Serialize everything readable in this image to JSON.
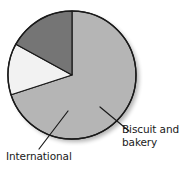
{
  "figure": {
    "background_color": "#ffffff",
    "outline_color": "#1a1a1a",
    "text_color": "#1a1a1a"
  },
  "labels": {
    "biscuit_and_bakery": "Biscuit and\nbakery",
    "international": "International"
  },
  "chart_data": {
    "type": "pie",
    "title": "",
    "xlabel": "",
    "ylabel": "",
    "legend_position": "callout-labels",
    "grid": false,
    "center": {
      "x": 72,
      "y": 75
    },
    "radius": 64,
    "start_angle_deg": -90,
    "direction": "clockwise",
    "categories": [
      "Other",
      "Biscuit and bakery",
      "International"
    ],
    "values": [
      70,
      13,
      17
    ],
    "value_unit": "percent",
    "slices": [
      {
        "name": "Other",
        "label": "",
        "value": 70,
        "color": "#b5b5b5",
        "start_angle_deg": -90,
        "end_angle_deg": 162,
        "labelled": false
      },
      {
        "name": "Biscuit and bakery",
        "label": "Biscuit and bakery",
        "value": 13,
        "color": "#f2f2f2",
        "start_angle_deg": 71,
        "end_angle_deg": 117,
        "labelled": true
      },
      {
        "name": "International",
        "label": "International",
        "value": 17,
        "color": "#757575",
        "start_angle_deg": 117,
        "end_angle_deg": 178,
        "labelled": true
      }
    ],
    "leader_lines": [
      {
        "name": "biscuit-leader",
        "from": {
          "x": 100,
          "y": 107
        },
        "to": {
          "x": 129,
          "y": 131
        }
      },
      {
        "name": "international-leader",
        "from": {
          "x": 68,
          "y": 111
        },
        "to": {
          "x": 39,
          "y": 149
        }
      }
    ]
  }
}
